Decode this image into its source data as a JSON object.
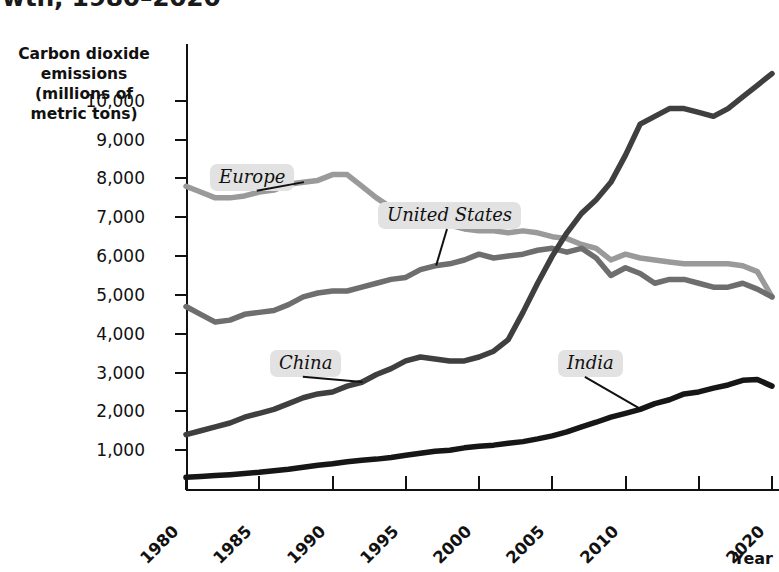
{
  "title": "wth, 1980–2020",
  "y_axis_caption_lines": [
    "Carbon dioxide",
    "emissions",
    "(millions of",
    "metric tons)"
  ],
  "x_axis_caption": "Year",
  "colors": {
    "europe": "#9a9a9a",
    "united_states": "#6e6e6e",
    "china": "#3f3f3f",
    "india": "#161616",
    "axis": "#111111",
    "callout_bg": "#e2e2e2"
  },
  "callouts": [
    {
      "key": "europe",
      "label": "Europe"
    },
    {
      "key": "united_states",
      "label": "United States"
    },
    {
      "key": "china",
      "label": "China"
    },
    {
      "key": "india",
      "label": "India"
    }
  ],
  "chart_data": {
    "type": "line",
    "title": "wth, 1980–2020",
    "xlabel": "Year",
    "ylabel": "Carbon dioxide emissions (millions of metric tons)",
    "xlim": [
      1980,
      2020
    ],
    "ylim": [
      0,
      11000
    ],
    "xticks": [
      1980,
      1985,
      1990,
      1995,
      2000,
      2005,
      2010,
      2015,
      2020
    ],
    "xtick_labels": [
      "1980",
      "1985",
      "1990",
      "1995",
      "2000",
      "2005",
      "2010",
      "",
      "2020"
    ],
    "yticks": [
      1000,
      2000,
      3000,
      4000,
      5000,
      6000,
      7000,
      8000,
      9000,
      10000
    ],
    "ytick_labels": [
      "1,000",
      "2,000",
      "3,000",
      "4,000",
      "5,000",
      "6,000",
      "7,000",
      "8,000",
      "9,000",
      "10,000"
    ],
    "grid": false,
    "legend": "inline-callouts",
    "x": [
      1980,
      1981,
      1982,
      1983,
      1984,
      1985,
      1986,
      1987,
      1988,
      1989,
      1990,
      1991,
      1992,
      1993,
      1994,
      1995,
      1996,
      1997,
      1998,
      1999,
      2000,
      2001,
      2002,
      2003,
      2004,
      2005,
      2006,
      2007,
      2008,
      2009,
      2010,
      2011,
      2012,
      2013,
      2014,
      2015,
      2016,
      2017,
      2018,
      2019,
      2020
    ],
    "series": [
      {
        "name": "Europe",
        "color": "#9a9a9a",
        "values": [
          7800,
          7650,
          7500,
          7500,
          7550,
          7650,
          7700,
          7850,
          7900,
          7950,
          8100,
          8100,
          7800,
          7500,
          7250,
          7050,
          7000,
          6900,
          6800,
          6700,
          6650,
          6650,
          6600,
          6650,
          6600,
          6500,
          6450,
          6300,
          6200,
          5900,
          6050,
          5950,
          5900,
          5850,
          5800,
          5800,
          5800,
          5800,
          5750,
          5600,
          4950
        ]
      },
      {
        "name": "United States",
        "color": "#6e6e6e",
        "values": [
          4700,
          4500,
          4300,
          4350,
          4500,
          4550,
          4600,
          4750,
          4950,
          5050,
          5100,
          5100,
          5200,
          5300,
          5400,
          5450,
          5650,
          5750,
          5800,
          5900,
          6050,
          5950,
          6000,
          6050,
          6150,
          6200,
          6100,
          6200,
          5950,
          5500,
          5700,
          5550,
          5300,
          5400,
          5400,
          5300,
          5200,
          5200,
          5300,
          5150,
          4950
        ]
      },
      {
        "name": "China",
        "color": "#3f3f3f",
        "values": [
          1400,
          1500,
          1600,
          1700,
          1850,
          1950,
          2050,
          2200,
          2350,
          2450,
          2500,
          2650,
          2750,
          2950,
          3100,
          3300,
          3400,
          3350,
          3300,
          3300,
          3400,
          3550,
          3850,
          4550,
          5300,
          6000,
          6600,
          7100,
          7450,
          7900,
          8600,
          9400,
          9600,
          9800,
          9800,
          9700,
          9600,
          9800,
          10100,
          10400,
          10700
        ]
      },
      {
        "name": "India",
        "color": "#161616",
        "values": [
          300,
          320,
          345,
          370,
          400,
          430,
          470,
          510,
          560,
          610,
          650,
          700,
          740,
          770,
          810,
          870,
          920,
          970,
          1000,
          1060,
          1100,
          1130,
          1180,
          1220,
          1290,
          1370,
          1470,
          1600,
          1720,
          1850,
          1950,
          2050,
          2200,
          2300,
          2450,
          2500,
          2600,
          2680,
          2800,
          2820,
          2650
        ]
      }
    ],
    "annotations": [
      {
        "text": "Europe",
        "points_to_series": "Europe",
        "points_to_x": 1988
      },
      {
        "text": "United States",
        "points_to_series": "United States",
        "points_to_x": 1997
      },
      {
        "text": "China",
        "points_to_series": "China",
        "points_to_x": 1992
      },
      {
        "text": "India",
        "points_to_series": "India",
        "points_to_x": 2011
      }
    ]
  }
}
